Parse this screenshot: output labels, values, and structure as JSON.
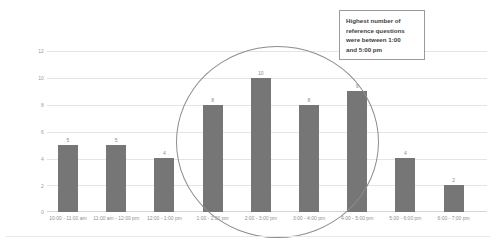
{
  "chart_data": {
    "type": "bar",
    "title": "",
    "xlabel": "",
    "ylabel": "Average Number of Reference Questions",
    "ylim": [
      0,
      12
    ],
    "yticks": [
      12,
      10,
      8,
      6,
      4,
      2,
      0
    ],
    "grid": true,
    "legend": "none",
    "bar_color": "#767676",
    "categories": [
      "10:00 - 11:00 am",
      "11:00 am - 12:00 pm",
      "12:00 - 1:00 pm",
      "1:00 - 2:00 pm",
      "2:00 - 3:00 pm",
      "3:00 - 4:00 pm",
      "4:00 - 5:00 pm",
      "5:00 - 6:00 pm",
      "6:00 - 7:00 pm"
    ],
    "values": [
      5,
      5,
      4,
      8,
      10,
      8,
      9,
      4,
      2
    ],
    "data_labels": [
      "5",
      "5",
      "4",
      "8",
      "10",
      "8",
      "9",
      "4",
      "2"
    ],
    "annotations": [
      {
        "type": "callout-box",
        "text": "Highest number of reference questions were between 1:00 and 5:00 pm"
      },
      {
        "type": "ellipse",
        "highlights": [
          "1:00 - 2:00 pm",
          "2:00 - 3:00 pm",
          "3:00 - 4:00 pm",
          "4:00 - 5:00 pm"
        ],
        "color": "#8d8d8d"
      }
    ]
  },
  "callout": {
    "line1": "Highest number of",
    "line2": "reference questions",
    "line3": "were between 1:00",
    "line4": "and 5:00 pm"
  }
}
